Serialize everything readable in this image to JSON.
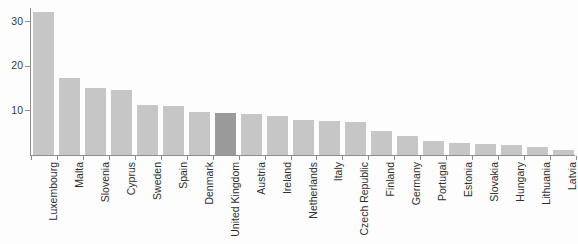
{
  "chart_data": {
    "type": "bar",
    "title": "",
    "subtitle": "",
    "xlabel": "",
    "ylabel": "",
    "ylim": [
      0,
      33
    ],
    "xlim": null,
    "grid": false,
    "legend": null,
    "legend_position": "none",
    "orientation": "vertical",
    "y_ticks": [
      10,
      20,
      30
    ],
    "y_tick_labels": [
      "10",
      "20",
      "30"
    ],
    "categories": [
      "Luxembourg",
      "Malta",
      "Slovenia",
      "Cyprus",
      "Sweden",
      "Spain",
      "Denmark",
      "United Kingdom",
      "Austria",
      "Ireland",
      "Netherlands",
      "Italy",
      "Czech Republic",
      "Finland",
      "Germany",
      "Portugal",
      "Estonia",
      "Slovakia",
      "Hungary",
      "Lithuania",
      "Latvia"
    ],
    "values": [
      32.0,
      17.2,
      15.0,
      14.6,
      11.2,
      11.1,
      9.7,
      9.4,
      9.1,
      8.7,
      7.9,
      7.6,
      7.5,
      5.3,
      4.2,
      3.1,
      2.6,
      2.4,
      2.3,
      1.7,
      1.2
    ],
    "highlighted_category": "United Kingdom",
    "highlighted_index": 7,
    "colors": {
      "bar": "#c6c6c6",
      "bar_highlight": "#9a9a9a",
      "axis": "#8d8d8d",
      "text": "#2f2f2f",
      "background": "#fdfdfd"
    }
  }
}
